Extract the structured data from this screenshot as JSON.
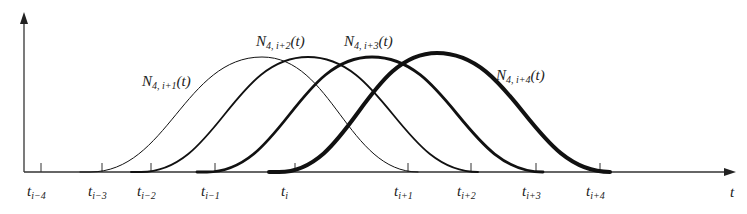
{
  "diagram": {
    "axis": {
      "x_label": "t",
      "ticks": [
        {
          "base": "t",
          "sub": "i−4",
          "x": 41
        },
        {
          "base": "t",
          "sub": "i−3",
          "x": 102
        },
        {
          "base": "t",
          "sub": "i−2",
          "x": 151
        },
        {
          "base": "t",
          "sub": "i−1",
          "x": 215
        },
        {
          "base": "t",
          "sub": "i",
          "x": 295
        },
        {
          "base": "t",
          "sub": "i+1",
          "x": 408
        },
        {
          "base": "t",
          "sub": "i+2",
          "x": 471
        },
        {
          "base": "t",
          "sub": "i+3",
          "x": 536
        },
        {
          "base": "t",
          "sub": "i+4",
          "x": 600
        }
      ]
    },
    "curves": [
      {
        "name": "N",
        "sub": "4, i+1",
        "arg": "(t)",
        "start": 90,
        "peak_x": 262,
        "peak_y": 57,
        "end": 418,
        "width": 1
      },
      {
        "name": "N",
        "sub": "4, i+2",
        "arg": "(t)",
        "start": 141,
        "peak_x": 308,
        "peak_y": 57,
        "end": 478,
        "width": 1.8
      },
      {
        "name": "N",
        "sub": "4, i+3",
        "arg": "(t)",
        "start": 207,
        "peak_x": 372,
        "peak_y": 57,
        "end": 543,
        "width": 2.8
      },
      {
        "name": "N",
        "sub": "4, i+4",
        "arg": "(t)",
        "start": 279,
        "peak_x": 437,
        "peak_y": 53,
        "end": 610,
        "width": 4
      }
    ],
    "labels": [
      {
        "text": "N",
        "sub": "4, i+1",
        "arg": "(t)",
        "x": 142,
        "y": 86
      },
      {
        "text": "N",
        "sub": "4, i+2",
        "arg": "(t)",
        "x": 256,
        "y": 46
      },
      {
        "text": "N",
        "sub": "4, i+3",
        "arg": "(t)",
        "x": 344,
        "y": 46
      },
      {
        "text": "N",
        "sub": "4, i+4",
        "arg": "(t)",
        "x": 496,
        "y": 80
      }
    ],
    "colors": {
      "stroke": "#111111",
      "axis": "#333333",
      "background": "#ffffff"
    }
  }
}
